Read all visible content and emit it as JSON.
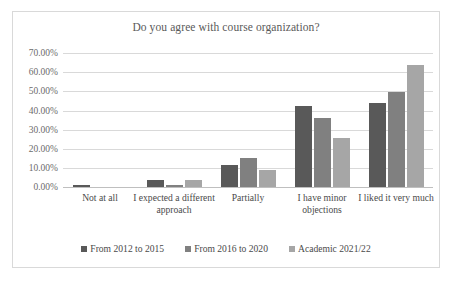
{
  "chart_data": {
    "type": "bar",
    "title": "Do you agree with course organization?",
    "xlabel": "",
    "ylabel": "",
    "ylim": [
      0,
      70
    ],
    "ytick_labels": [
      "70.00%",
      "60.00%",
      "50.00%",
      "40.00%",
      "30.00%",
      "20.00%",
      "10.00%",
      "0.00%"
    ],
    "ytick_values": [
      70,
      60,
      50,
      40,
      30,
      20,
      10,
      0
    ],
    "grid": true,
    "legend_position": "bottom",
    "categories": [
      "Not at all",
      "I expected a different approach",
      "Partially",
      "I have minor objections",
      "I liked it very much"
    ],
    "series": [
      {
        "name": "From 2012 to 2015",
        "color": "#595959",
        "values": [
          1.0,
          3.5,
          11.5,
          42.5,
          44.0
        ]
      },
      {
        "name": "From 2016 to 2020",
        "color": "#808080",
        "values": [
          0.0,
          1.0,
          15.0,
          36.0,
          49.5
        ]
      },
      {
        "name": "Academic 2021/22",
        "color": "#a6a6a6",
        "values": [
          0.0,
          3.5,
          9.0,
          25.5,
          64.0
        ]
      }
    ]
  }
}
